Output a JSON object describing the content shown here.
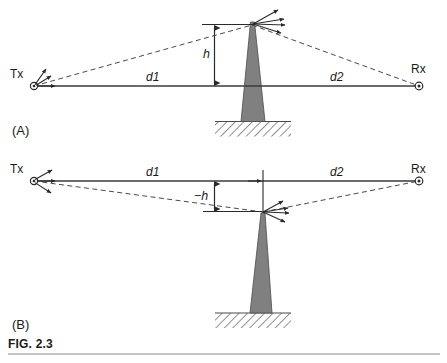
{
  "figure": {
    "caption_label": "FIG. 2.3",
    "panels": [
      {
        "id": "A",
        "label": "(A)",
        "tx_label": "Tx",
        "rx_label": "Rx",
        "d1_label": "d1",
        "d2_label": "d2",
        "height_label": "h",
        "obstacle": "transmitter-mast",
        "ground": "hatched-ground",
        "description": "Obstacle tip above the transmitter-receiver line, positive clearance h"
      },
      {
        "id": "B",
        "label": "(B)",
        "tx_label": "Tx",
        "rx_label": "Rx",
        "d1_label": "d1",
        "d2_label": "d2",
        "height_label": "−h",
        "obstacle": "transmitter-mast",
        "ground": "hatched-ground",
        "description": "Obstacle tip below the transmitter-receiver line, negative clearance minus h"
      }
    ]
  },
  "colors": {
    "line": "#3a3a3a",
    "mast_fill": "#808080",
    "mast_stroke": "#4a4a4a",
    "hatch": "#555555",
    "text": "#1b1b1b",
    "rule": "#8a8a8a"
  },
  "icons": {
    "tx_antenna": "antenna-icon",
    "rx_antenna": "antenna-icon",
    "mast_antenna": "antenna-icon",
    "ground": "ground-hatch-icon"
  }
}
